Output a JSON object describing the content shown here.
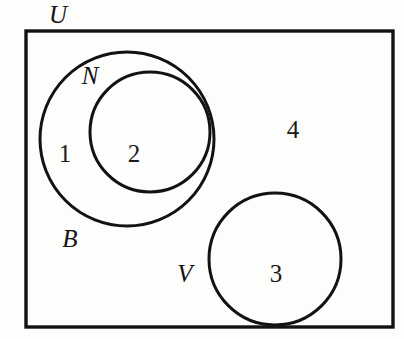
{
  "diagram": {
    "kind": "venn-diagram",
    "canvas": {
      "width": 404,
      "height": 339
    },
    "colors": {
      "background": "#fdfdfb",
      "stroke": "#121212",
      "label_text": "#141414",
      "number_text": "#1a1a1a"
    },
    "universe": {
      "label": "U",
      "shape": "rectangle",
      "x": 26,
      "y": 31,
      "width": 367,
      "height": 296,
      "stroke_width": 3.4,
      "label_x": 58,
      "label_y": 23,
      "label_font_size": 25
    },
    "sets": [
      {
        "id": "B",
        "label": "B",
        "shape": "circle",
        "cx": 127,
        "cy": 139,
        "r": 87,
        "stroke_width": 3.0,
        "label_x": 70,
        "label_y": 247,
        "label_font_size": 25
      },
      {
        "id": "N",
        "label": "N",
        "shape": "circle",
        "cx": 150,
        "cy": 132,
        "r": 60,
        "stroke_width": 3.0,
        "label_x": 90,
        "label_y": 84,
        "label_font_size": 25
      },
      {
        "id": "V",
        "label": "V",
        "shape": "circle",
        "cx": 275,
        "cy": 259,
        "r": 66,
        "stroke_width": 3.0,
        "label_x": 185,
        "label_y": 282,
        "label_font_size": 25
      }
    ],
    "regions": [
      {
        "id": "region-1",
        "number": "1",
        "meaning": "inside B but outside N",
        "x": 65,
        "y": 162,
        "font_size": 25
      },
      {
        "id": "region-2",
        "number": "2",
        "meaning": "inside N",
        "x": 134,
        "y": 162,
        "font_size": 25
      },
      {
        "id": "region-3",
        "number": "3",
        "meaning": "inside V",
        "x": 276,
        "y": 282,
        "font_size": 25
      },
      {
        "id": "region-4",
        "number": "4",
        "meaning": "inside U but outside B, N and V",
        "x": 293,
        "y": 138,
        "font_size": 25
      }
    ]
  }
}
